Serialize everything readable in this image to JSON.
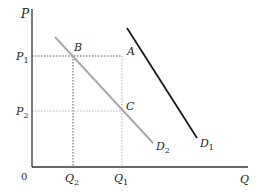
{
  "diagram": {
    "type": "supply-demand",
    "axes": {
      "y_label": "P",
      "x_label": "Q",
      "origin_label": "0"
    },
    "price_levels": [
      {
        "label": "P",
        "sub": "1"
      },
      {
        "label": "P",
        "sub": "2"
      }
    ],
    "quantity_levels": [
      {
        "label": "Q",
        "sub": "2"
      },
      {
        "label": "Q",
        "sub": "1"
      }
    ],
    "points": [
      {
        "label": "A"
      },
      {
        "label": "B"
      },
      {
        "label": "C"
      }
    ],
    "curves": [
      {
        "label": "D",
        "sub": "1",
        "color": "#1a1a1a"
      },
      {
        "label": "D",
        "sub": "2",
        "color": "#a8a8a8"
      }
    ],
    "colors": {
      "axis": "#333333",
      "guide": "#555555",
      "guide_light": "#aaaaaa"
    }
  }
}
